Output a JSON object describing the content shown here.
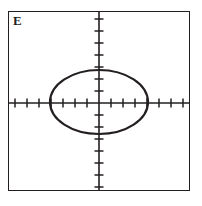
{
  "figure": {
    "panel_label": "E",
    "colors": {
      "ink": "#231f20",
      "background": "#ffffff"
    }
  },
  "chart_data": {
    "type": "scatter",
    "title": "E",
    "xlabel": "",
    "ylabel": "",
    "grid": false,
    "legend": null,
    "axes": {
      "origin_px": [
        99,
        103
      ],
      "x_axis_visible": true,
      "y_axis_visible": true,
      "xlim": [
        -7.5,
        7.5
      ],
      "ylim": [
        -7.5,
        7.5
      ],
      "tick_spacing": 1,
      "tick_labels": [],
      "x_ticks": [
        -7,
        -6,
        -5,
        -4,
        -3,
        -2,
        -1,
        1,
        2,
        3,
        4,
        5,
        6,
        7
      ],
      "y_ticks": [
        -7,
        -6,
        -5,
        -4,
        -3,
        -2,
        -1,
        1,
        2,
        3,
        4,
        5,
        6,
        7
      ]
    },
    "curves": [
      {
        "name": "ellipse",
        "shape": "ellipse",
        "center": [
          0,
          0
        ],
        "semi_axis_x": 4,
        "semi_axis_y": 2.6,
        "center_px": [
          99,
          102
        ],
        "radius_x_px": 49,
        "radius_y_px": 32,
        "stroke_width_px": 2.2,
        "filled": false
      }
    ]
  }
}
